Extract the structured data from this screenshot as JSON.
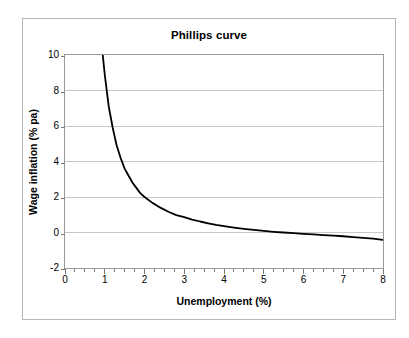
{
  "chart_data": {
    "type": "line",
    "title": "Phillips curve",
    "xlabel": "Unemployment (%)",
    "ylabel": "Wage inflation (% pa)",
    "xlim": [
      0,
      8
    ],
    "ylim": [
      -2,
      10
    ],
    "xticks": [
      "0",
      "1",
      "2",
      "3",
      "4",
      "5",
      "6",
      "7",
      "8"
    ],
    "xtick_values": [
      0,
      1,
      2,
      3,
      4,
      5,
      6,
      7,
      8
    ],
    "x_minor_tick_interval": 0.25,
    "yticks": [
      "-2",
      "0",
      "2",
      "4",
      "6",
      "8",
      "10"
    ],
    "ytick_values": [
      -2,
      0,
      2,
      4,
      6,
      8,
      10
    ],
    "grid": "horizontal",
    "grid_color": "#c8c8c8",
    "legend": "none",
    "line_color": "#000000",
    "line_width": 1.8,
    "background_color": "#ffffff",
    "plot_border_color": "#9a9a9a",
    "frame_border_color": "#b6b6b6",
    "series": [
      {
        "name": "Phillips curve",
        "x": [
          0.95,
          1.0,
          1.1,
          1.2,
          1.3,
          1.4,
          1.5,
          1.6,
          1.7,
          1.8,
          1.9,
          2.0,
          2.2,
          2.4,
          2.6,
          2.8,
          3.0,
          3.2,
          3.4,
          3.6,
          3.8,
          4.0,
          4.25,
          4.5,
          4.75,
          5.0,
          5.25,
          5.5,
          5.75,
          6.0,
          6.25,
          6.5,
          6.75,
          7.0,
          7.25,
          7.5,
          7.75,
          8.0
        ],
        "y": [
          10.0,
          8.9,
          7.1,
          5.9,
          4.9,
          4.2,
          3.6,
          3.2,
          2.8,
          2.5,
          2.2,
          2.0,
          1.67,
          1.4,
          1.17,
          0.98,
          0.87,
          0.73,
          0.62,
          0.52,
          0.43,
          0.36,
          0.28,
          0.21,
          0.15,
          0.09,
          0.04,
          0.0,
          -0.04,
          -0.08,
          -0.11,
          -0.15,
          -0.18,
          -0.21,
          -0.26,
          -0.3,
          -0.35,
          -0.42
        ]
      }
    ]
  }
}
